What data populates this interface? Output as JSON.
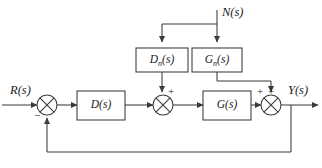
{
  "diagram": {
    "stroke_color": "#3a3a3a",
    "text_color": "#1a1a1a",
    "background": "#ffffff",
    "signals": {
      "input": "R(s)",
      "output": "Y(s)",
      "noise": "N(s)"
    },
    "blocks": [
      {
        "id": "controller",
        "base": "D",
        "subscript": "",
        "arg": "(s)",
        "label": "D(s)"
      },
      {
        "id": "plant",
        "base": "G",
        "subscript": "",
        "arg": "(s)",
        "label": "G(s)"
      },
      {
        "id": "feedforward-compensator",
        "base": "D",
        "subscript": "n",
        "arg": "(s)",
        "label": "Dn(s)"
      },
      {
        "id": "noise-path",
        "base": "G",
        "subscript": "n",
        "arg": "(s)",
        "label": "Gn(s)"
      }
    ],
    "summing_junctions": [
      {
        "id": "error-junction",
        "signs": [
          "-"
        ]
      },
      {
        "id": "control-junction",
        "signs": [
          "+"
        ]
      },
      {
        "id": "output-junction",
        "signs": [
          "+",
          "+"
        ]
      }
    ],
    "signs": {
      "minus": "−",
      "plus": "+"
    }
  }
}
